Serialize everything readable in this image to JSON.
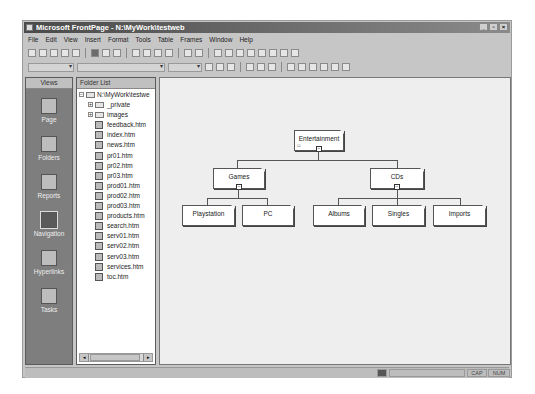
{
  "window": {
    "title": "Microsoft FrontPage - N:\\MyWork\\testweb",
    "controls": [
      "minimize",
      "restore",
      "close"
    ]
  },
  "menubar": [
    "File",
    "Edit",
    "View",
    "Insert",
    "Format",
    "Tools",
    "Table",
    "Frames",
    "Window",
    "Help"
  ],
  "views_bar": {
    "header": "Views",
    "items": [
      {
        "label": "Page",
        "icon": "page-icon"
      },
      {
        "label": "Folders",
        "icon": "folders-icon"
      },
      {
        "label": "Reports",
        "icon": "reports-icon"
      },
      {
        "label": "Navigation",
        "icon": "navigation-icon",
        "active": true
      },
      {
        "label": "Hyperlinks",
        "icon": "hyperlinks-icon"
      },
      {
        "label": "Tasks",
        "icon": "tasks-icon"
      }
    ]
  },
  "folder_list": {
    "header": "Folder List",
    "root": "N:\\MyWork\\testwe",
    "folders": [
      "_private",
      "images"
    ],
    "files": [
      "feedback.htm",
      "index.htm",
      "news.htm",
      "pr01.htm",
      "pr02.htm",
      "pr03.htm",
      "prod01.htm",
      "prod02.htm",
      "prod03.htm",
      "products.htm",
      "search.htm",
      "serv01.htm",
      "serv02.htm",
      "serv03.htm",
      "services.htm",
      "toc.htm"
    ]
  },
  "navigation": {
    "root": "Entertainment",
    "level1": [
      "Games",
      "CDs"
    ],
    "games_children": [
      "Playstation",
      "PC"
    ],
    "cds_children": [
      "Albums",
      "Singles",
      "Imports"
    ]
  },
  "status": {
    "cap": "CAP",
    "num": "NUM"
  }
}
